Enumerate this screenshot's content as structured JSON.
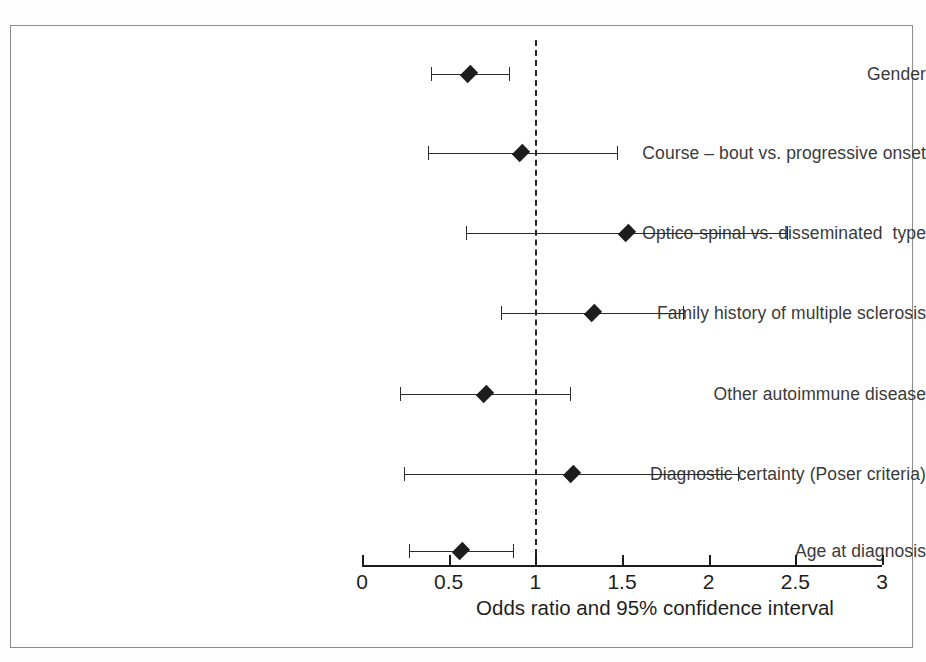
{
  "figure": {
    "background_color": "#ffffff",
    "frame_color": "#8d8d8d",
    "marker_color": "#1d1d1d",
    "line_color": "#2a2a2a",
    "axis_color": "#1b1b1b"
  },
  "chart_data": {
    "type": "scatter",
    "chart_subtype": "forest-plot",
    "title": "",
    "xlabel": "Odds ratio and 95% confidence interval",
    "ylabel": "",
    "xlim": [
      0,
      3
    ],
    "ylim": null,
    "grid": false,
    "legend": null,
    "reference_line": {
      "value": 1,
      "style": "dashed",
      "label": "1"
    },
    "x_ticks": [
      0,
      0.5,
      1,
      1.5,
      2,
      2.5,
      3
    ],
    "x_tick_labels": [
      "0",
      "0.5",
      "1",
      "1.5",
      "2",
      "2.5",
      "3"
    ],
    "categories": [
      "Gender",
      "Course – bout vs. progressive onset",
      "Optico-spinal vs. disseminated  type",
      "Family history of multiple sclerosis",
      "Other autoimmune disease",
      "Diagnostic certainty (Poser criteria)",
      "Age at diagnosis"
    ],
    "points": [
      {
        "label": "Gender",
        "odds_ratio": 0.62,
        "ci_low": 0.4,
        "ci_high": 0.85
      },
      {
        "label": "Course – bout vs. progressive onset",
        "odds_ratio": 0.92,
        "ci_low": 0.38,
        "ci_high": 1.47
      },
      {
        "label": "Optico-spinal vs. disseminated  type",
        "odds_ratio": 1.53,
        "ci_low": 0.6,
        "ci_high": 2.45
      },
      {
        "label": "Family history of multiple sclerosis",
        "odds_ratio": 1.33,
        "ci_low": 0.8,
        "ci_high": 1.85
      },
      {
        "label": "Other autoimmune disease",
        "odds_ratio": 0.71,
        "ci_low": 0.22,
        "ci_high": 1.2
      },
      {
        "label": "Diagnostic certainty (Poser criteria)",
        "odds_ratio": 1.21,
        "ci_low": 0.24,
        "ci_high": 2.17
      },
      {
        "label": "Age at diagnosis",
        "odds_ratio": 0.57,
        "ci_low": 0.27,
        "ci_high": 0.87
      }
    ]
  },
  "layout": {
    "plot_x0_px": 362,
    "plot_x3_px": 882,
    "px_per_unit": 173.33,
    "axis_y_px": 565,
    "label_right_px": 352,
    "row_y_px": [
      74,
      153,
      233,
      313,
      394,
      474,
      551
    ],
    "tick_length_px": 10,
    "cap_half_height_px": 7,
    "xlabel_center_px": 655,
    "xlabel_y_px": 596
  }
}
